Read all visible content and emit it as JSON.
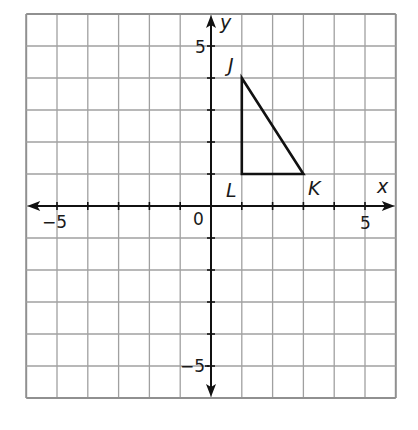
{
  "figure": {
    "type": "coordinate-grid",
    "x_range": [
      -6,
      6
    ],
    "y_range": [
      -6,
      6
    ],
    "grid_step": 1,
    "colors": {
      "grid": "#a0a0a0",
      "border": "#909090",
      "axis": "#111111",
      "shape": "#111111",
      "background": "#ffffff"
    }
  },
  "axes": {
    "x_label": "x",
    "y_label": "y",
    "origin_label": "0",
    "x_tick_labels": [
      {
        "value": -5,
        "text": "−5"
      },
      {
        "value": 5,
        "text": "5"
      }
    ],
    "y_tick_labels": [
      {
        "value": 5,
        "text": "5"
      },
      {
        "value": -5,
        "text": "−5"
      }
    ]
  },
  "triangle": {
    "name": "JKL",
    "vertices": [
      {
        "label": "J",
        "x": 1,
        "y": 4
      },
      {
        "label": "K",
        "x": 3,
        "y": 1
      },
      {
        "label": "L",
        "x": 1,
        "y": 1
      }
    ]
  }
}
